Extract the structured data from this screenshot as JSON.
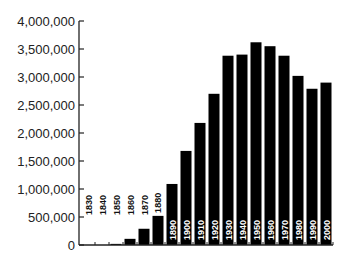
{
  "chart_data": {
    "type": "bar",
    "title": "",
    "xlabel": "",
    "ylabel": "",
    "ylim": [
      0,
      4000000
    ],
    "yticks": [
      0,
      500000,
      1000000,
      1500000,
      2000000,
      2500000,
      3000000,
      3500000,
      4000000
    ],
    "ytick_labels": [
      "0",
      "500,000",
      "1,000,000",
      "1,500,000",
      "2,000,000",
      "2,500,000",
      "3,000,000",
      "3,500,000",
      "4,000,000"
    ],
    "grid": false,
    "legend": null,
    "categories": [
      "1830",
      "1840",
      "1850",
      "1860",
      "1870",
      "1880",
      "1890",
      "1900",
      "1910",
      "1920",
      "1930",
      "1940",
      "1950",
      "1960",
      "1970",
      "1980",
      "1990",
      "2000"
    ],
    "values": [
      0,
      0,
      20000,
      110000,
      290000,
      520000,
      1090000,
      1680000,
      2180000,
      2700000,
      3380000,
      3400000,
      3620000,
      3550000,
      3380000,
      3020000,
      2790000,
      2900000
    ],
    "bar_color": "#000000",
    "label_placement": "category labels drawn vertically inside/above bars near the baseline"
  }
}
